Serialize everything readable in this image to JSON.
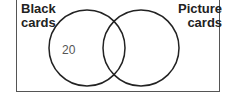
{
  "diagram": {
    "type": "venn",
    "sets": [
      {
        "label_line1": "Black",
        "label_line2": "cards"
      },
      {
        "label_line1": "Picture",
        "label_line2": "cards"
      }
    ],
    "regions": {
      "black_only": "20"
    },
    "colors": {
      "stroke": "#222222",
      "frame": "#555555",
      "background": "#ffffff"
    }
  }
}
